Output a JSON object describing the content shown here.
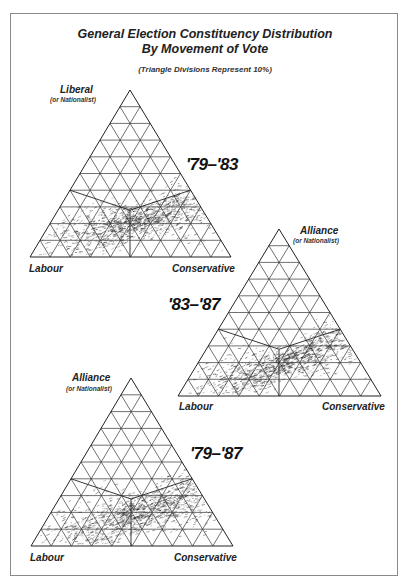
{
  "header": {
    "title_line1": "General Election Constituency Distribution",
    "title_line2": "By Movement of Vote",
    "subtitle": "(Triangle Divisions Represent 10%)"
  },
  "chart_data": [
    {
      "type": "scatter",
      "subtype": "ternary",
      "title": "'79–'83",
      "axes": {
        "top": "Liberal",
        "top_sub": "(or Nationalist)",
        "left": "Labour",
        "right": "Conservative"
      },
      "grid_divisions": 10,
      "grid_step_percent": 10,
      "cloud": {
        "center_x": 0.55,
        "center_y": 0.22,
        "spread_x": 0.24,
        "spread_y": 0.08,
        "tilt": 0.35,
        "count": 1500
      }
    },
    {
      "type": "scatter",
      "subtype": "ternary",
      "title": "'83–'87",
      "axes": {
        "top": "Alliance",
        "top_sub": "(or Nationalist)",
        "left": "Labour",
        "right": "Conservative"
      },
      "grid_divisions": 10,
      "grid_step_percent": 10,
      "cloud": {
        "center_x": 0.52,
        "center_y": 0.2,
        "spread_x": 0.26,
        "spread_y": 0.07,
        "tilt": 0.45,
        "count": 1500
      }
    },
    {
      "type": "scatter",
      "subtype": "ternary",
      "title": "'79–'87",
      "axes": {
        "top": "Alliance",
        "top_sub": "(or Nationalist)",
        "left": "Labour",
        "right": "Conservative"
      },
      "grid_divisions": 10,
      "grid_step_percent": 10,
      "cloud": {
        "center_x": 0.54,
        "center_y": 0.2,
        "spread_x": 0.25,
        "spread_y": 0.08,
        "tilt": 0.4,
        "count": 1500
      }
    }
  ],
  "triangles": [
    {
      "apex": [
        130,
        90
      ],
      "left": [
        30,
        257
      ],
      "right": [
        231,
        257
      ]
    },
    {
      "apex": [
        279,
        229
      ],
      "left": [
        178,
        396
      ],
      "right": [
        381,
        396
      ]
    },
    {
      "apex": [
        131,
        378
      ],
      "left": [
        31,
        546
      ],
      "right": [
        233,
        546
      ]
    }
  ]
}
